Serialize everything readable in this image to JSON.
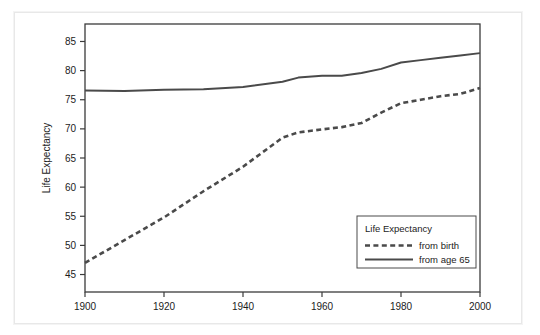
{
  "chart_data": {
    "type": "line",
    "title": "",
    "xlabel": "",
    "ylabel": "Life Expectancy",
    "xlim": [
      1900,
      2000
    ],
    "ylim": [
      42,
      88
    ],
    "xticks": [
      1900,
      1920,
      1940,
      1960,
      1980,
      2000
    ],
    "yticks": [
      45,
      50,
      55,
      60,
      65,
      70,
      75,
      80,
      85
    ],
    "grid": false,
    "legend_position": "lower right",
    "legend_title": "Life Expectancy",
    "x": [
      1900,
      1910,
      1920,
      1930,
      1940,
      1950,
      1954,
      1960,
      1965,
      1970,
      1975,
      1980,
      1985,
      1990,
      1995,
      2000
    ],
    "series": [
      {
        "name": "from birth",
        "style": "dashed",
        "color": "#4a4a4a",
        "values": [
          47.0,
          50.9,
          54.8,
          59.3,
          63.5,
          68.5,
          69.4,
          69.9,
          70.3,
          71.0,
          72.8,
          74.4,
          75.0,
          75.6,
          76.0,
          77.0
        ]
      },
      {
        "name": "from age 65",
        "style": "solid",
        "color": "#4a4a4a",
        "values": [
          76.6,
          76.5,
          76.7,
          76.8,
          77.2,
          78.1,
          78.8,
          79.1,
          79.1,
          79.6,
          80.3,
          81.4,
          81.8,
          82.2,
          82.6,
          83.0
        ]
      }
    ]
  },
  "axes": {
    "y_title": "Life Expectancy",
    "x_tick_labels": [
      "1900",
      "1920",
      "1940",
      "1960",
      "1980",
      "2000"
    ],
    "y_tick_labels": [
      "45",
      "50",
      "55",
      "60",
      "65",
      "70",
      "75",
      "80",
      "85"
    ]
  },
  "legend": {
    "title": "Life Expectancy",
    "entries": [
      {
        "label": "from birth",
        "style": "dashed"
      },
      {
        "label": "from age 65",
        "style": "solid"
      }
    ]
  },
  "colors": {
    "line": "#4a4a4a",
    "frame": "#3b3b3b",
    "text": "#1c1c1c",
    "background": "#ffffff",
    "outer_border": "#e8e8e8"
  }
}
